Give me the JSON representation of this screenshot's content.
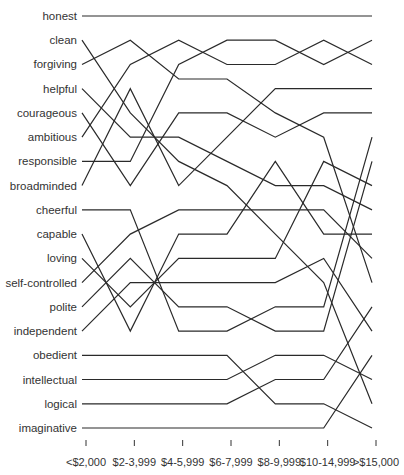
{
  "chart_data": {
    "type": "line",
    "subtype": "rank-slope",
    "title": "",
    "xlabel": "",
    "ylabel": "",
    "x_categories": [
      "<$2,000",
      "$2-3,999",
      "$4-5,999",
      "$6-7,999",
      "$8-9,999",
      "$10-14,999",
      ">$15,000"
    ],
    "rank_range": [
      1,
      18
    ],
    "grid": false,
    "legend": "none; series labeled at left by starting rank",
    "series": [
      {
        "name": "honest",
        "values": [
          1,
          1,
          1,
          1,
          1,
          1,
          1
        ]
      },
      {
        "name": "clean",
        "values": [
          2,
          5,
          7,
          8,
          10,
          12,
          17
        ]
      },
      {
        "name": "forgiving",
        "values": [
          3,
          2,
          3.6,
          3.6,
          5,
          6,
          12
        ]
      },
      {
        "name": "helpful",
        "values": [
          4,
          6,
          6,
          7,
          8,
          8,
          9
        ]
      },
      {
        "name": "courageous",
        "values": [
          5,
          8,
          5,
          5,
          6,
          5,
          5
        ]
      },
      {
        "name": "ambitious",
        "values": [
          6,
          3,
          2,
          3,
          3,
          2,
          3
        ]
      },
      {
        "name": "responsible",
        "values": [
          7,
          7,
          3,
          2,
          2,
          3,
          2
        ]
      },
      {
        "name": "broadminded",
        "values": [
          8,
          4,
          8,
          6,
          4,
          4,
          4
        ]
      },
      {
        "name": "cheerful",
        "values": [
          9,
          9,
          14,
          14,
          13,
          13,
          6
        ]
      },
      {
        "name": "capable",
        "values": [
          10,
          14,
          10,
          10,
          7,
          10,
          10
        ]
      },
      {
        "name": "loving",
        "values": [
          11,
          13,
          11,
          11,
          11,
          7,
          8
        ]
      },
      {
        "name": "self-controlled",
        "values": [
          12,
          10,
          9,
          9,
          9,
          9,
          11
        ]
      },
      {
        "name": "polite",
        "values": [
          13,
          11,
          13,
          13,
          14,
          14,
          7
        ]
      },
      {
        "name": "independent",
        "values": [
          14,
          12,
          12,
          12,
          12,
          11,
          14
        ]
      },
      {
        "name": "obedient",
        "values": [
          15,
          15,
          15,
          15,
          17,
          17,
          18
        ]
      },
      {
        "name": "intellectual",
        "values": [
          16,
          16,
          16,
          16,
          15,
          15,
          16
        ]
      },
      {
        "name": "logical",
        "values": [
          17,
          17,
          17,
          17,
          16,
          16,
          13
        ]
      },
      {
        "name": "imaginative",
        "values": [
          18,
          18,
          18,
          18,
          18,
          18,
          15
        ]
      }
    ]
  },
  "colors": {
    "line": "#2a2a2a",
    "text": "#333333",
    "background": "#ffffff"
  }
}
